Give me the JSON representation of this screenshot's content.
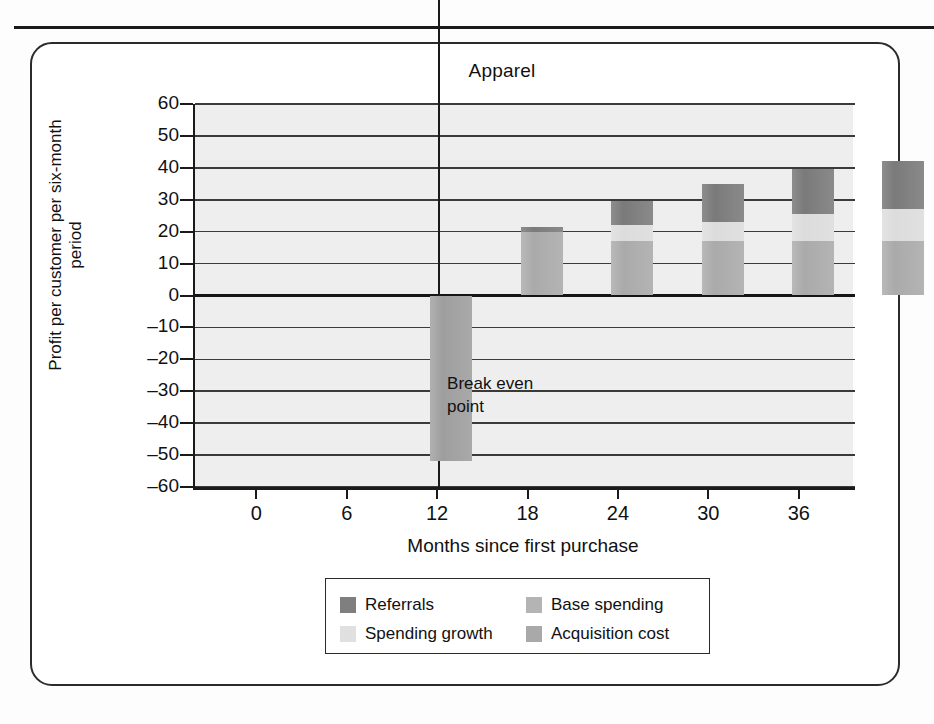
{
  "chart_data": {
    "type": "bar",
    "subtype": "stacked-bar",
    "title": "Apparel",
    "xlabel": "Months since first purchase",
    "ylabel": "Profit per customer per six-month period",
    "categories": [
      "0",
      "6",
      "12",
      "18",
      "24",
      "30",
      "36"
    ],
    "ylim": [
      -60,
      60
    ],
    "yticks": [
      "60",
      "50",
      "40",
      "30",
      "20",
      "10",
      "0",
      "–10",
      "–20",
      "–30",
      "–40",
      "–50",
      "–60"
    ],
    "grid": true,
    "legend_position": "bottom",
    "series": [
      {
        "name": "Acquisition cost",
        "color": "#a9a9a9",
        "values": [
          -52,
          0,
          0,
          0,
          0,
          0,
          0
        ]
      },
      {
        "name": "Base spending",
        "color": "#b4b4b4",
        "values": [
          0,
          20,
          17,
          17,
          17,
          17,
          17
        ]
      },
      {
        "name": "Spending growth",
        "color": "#e0e0e0",
        "values": [
          0,
          0,
          5,
          6,
          8.5,
          10,
          12.5
        ]
      },
      {
        "name": "Referrals",
        "color": "#7f7f7f",
        "values": [
          0,
          1.5,
          7.5,
          12,
          14,
          15,
          15.5
        ]
      }
    ],
    "totals": [
      -52,
      21.5,
      29.5,
      35,
      39.5,
      42,
      45
    ],
    "annotations": [
      {
        "text": "Break even",
        "text2": "point",
        "at_x": "12"
      }
    ]
  },
  "legend": {
    "items": [
      {
        "label": "Referrals",
        "color": "#7f7f7f"
      },
      {
        "label": "Base spending",
        "color": "#b4b4b4"
      },
      {
        "label": "Spending growth",
        "color": "#e0e0e0"
      },
      {
        "label": "Acquisition cost",
        "color": "#a9a9a9"
      }
    ]
  },
  "annotation": {
    "line1": "Break even",
    "line2": "point"
  }
}
